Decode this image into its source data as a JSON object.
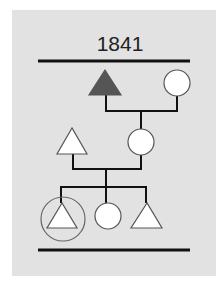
{
  "diagram": {
    "type": "pedigree-chart",
    "title": "1841",
    "colors": {
      "background": "#e2e2e2",
      "line": "#111111",
      "filled_male": "#555555",
      "shape_fill": "#ffffff",
      "highlight_ring": "#666666"
    },
    "generations": [
      {
        "level": 1,
        "members": [
          {
            "id": "grandfather",
            "shape": "triangle",
            "filled": true
          },
          {
            "id": "grandmother",
            "shape": "circle",
            "filled": false
          }
        ]
      },
      {
        "level": 2,
        "members": [
          {
            "id": "father",
            "shape": "triangle",
            "filled": false
          },
          {
            "id": "mother",
            "shape": "circle",
            "filled": false
          }
        ]
      },
      {
        "level": 3,
        "members": [
          {
            "id": "son-1",
            "shape": "triangle",
            "filled": false,
            "highlighted": true
          },
          {
            "id": "daughter",
            "shape": "circle",
            "filled": false
          },
          {
            "id": "son-2",
            "shape": "triangle",
            "filled": false
          }
        ]
      }
    ]
  }
}
